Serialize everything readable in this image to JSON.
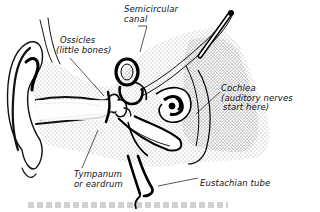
{
  "diagram": {
    "labels": {
      "semicircular_canal": [
        "Semicircular",
        "canal"
      ],
      "ossicles": [
        "Ossicles",
        "(little bones)"
      ],
      "cochlea": [
        "Cochlea",
        "(auditory nerves",
        "start here)"
      ],
      "tympanum": [
        "Tympanum",
        "or eardrum"
      ],
      "eustachian_tube": [
        "Eustachian tube"
      ]
    },
    "caption": ""
  },
  "colors": {
    "ink": "#111111",
    "background": "#ffffff",
    "stipple": "#333333"
  }
}
